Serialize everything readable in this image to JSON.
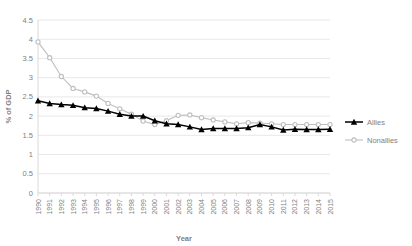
{
  "chart_data": {
    "type": "line",
    "title": "",
    "xlabel": "Year",
    "ylabel": "% of GDP",
    "xlim": [
      1990,
      2015
    ],
    "ylim": [
      0,
      4.5
    ],
    "ytick_values": [
      0,
      0.5,
      1,
      1.5,
      2,
      2.5,
      3,
      3.5,
      4,
      4.5
    ],
    "ytick_labels": [
      "0",
      "0.5",
      "1",
      "1.5",
      "2",
      "2.5",
      "3",
      "3.5",
      "4",
      "4.5"
    ],
    "grid": true,
    "legend_position": "right",
    "categories": [
      1990,
      1991,
      1992,
      1993,
      1994,
      1995,
      1996,
      1997,
      1998,
      1999,
      2000,
      2001,
      2002,
      2003,
      2004,
      2005,
      2006,
      2007,
      2008,
      2009,
      2010,
      2011,
      2012,
      2013,
      2014,
      2015
    ],
    "xtick_labels": [
      "1990",
      "1991",
      "1992",
      "1993",
      "1994",
      "1995",
      "1996",
      "1997",
      "1998",
      "1999",
      "2000",
      "2001",
      "2002",
      "2003",
      "2004",
      "2005",
      "2006",
      "2007",
      "2008",
      "2009",
      "2010",
      "2011",
      "2012",
      "2013",
      "2014",
      "2015"
    ],
    "series": [
      {
        "name": "Allies",
        "color": "#000000",
        "marker": "triangle",
        "values": [
          2.4,
          2.33,
          2.3,
          2.28,
          2.22,
          2.2,
          2.13,
          2.05,
          2.0,
          2.0,
          1.88,
          1.8,
          1.78,
          1.72,
          1.65,
          1.68,
          1.68,
          1.68,
          1.7,
          1.78,
          1.72,
          1.64,
          1.66,
          1.65,
          1.65,
          1.66
        ]
      },
      {
        "name": "Nonallies",
        "color": "#bfbfbf",
        "marker": "circle",
        "values": [
          3.93,
          3.52,
          3.03,
          2.72,
          2.63,
          2.52,
          2.33,
          2.19,
          2.05,
          1.87,
          1.78,
          1.88,
          2.02,
          2.03,
          1.96,
          1.9,
          1.85,
          1.8,
          1.83,
          1.82,
          1.8,
          1.78,
          1.78,
          1.78,
          1.78,
          1.78
        ]
      }
    ]
  },
  "legend": {
    "items": [
      {
        "label": "Allies"
      },
      {
        "label": "Nonallies"
      }
    ]
  },
  "axes": {
    "x_title": "Year",
    "y_title": "% of GDP"
  }
}
